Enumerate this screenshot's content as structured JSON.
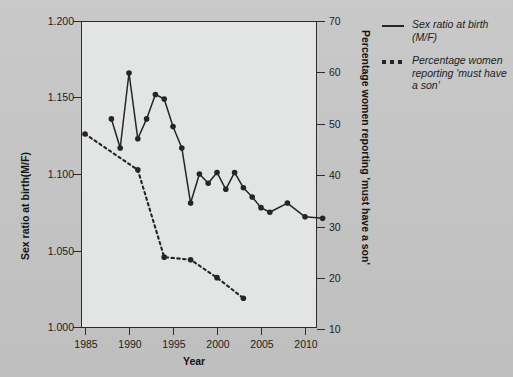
{
  "figure": {
    "background_color": "#c5c5c5",
    "plot_background_color": "#e3e4e4",
    "line_color": "#252525"
  },
  "chart_data": {
    "type": "line",
    "title": "",
    "xlabel": "Year",
    "ylabel_left": "Sex ratio at birth(M/F)",
    "ylabel_right": "Percentage women reporting 'must have a son'",
    "xlim": [
      1983,
      2014
    ],
    "xticks": [
      1985,
      1990,
      1995,
      2000,
      2005,
      2010
    ],
    "xticklabels": [
      "1985",
      "1990",
      "1995",
      "2000",
      "2005",
      "2010"
    ],
    "ylim_left": [
      1.0,
      1.2
    ],
    "yticks_left": [
      1.0,
      1.05,
      1.1,
      1.15,
      1.2
    ],
    "yticklabels_left": [
      "1.000",
      "1.050",
      "1.100",
      "1.150",
      "1.200"
    ],
    "ylim_right": [
      10,
      70
    ],
    "yticks_right": [
      10,
      20,
      30,
      40,
      50,
      60,
      70
    ],
    "yticklabels_right": [
      "10",
      "20",
      "30",
      "40",
      "50",
      "60",
      "70"
    ],
    "grid": false,
    "legend_position": "right-outside",
    "series": [
      {
        "name": "Sex ratio at birth (M/F)",
        "axis": "left",
        "style": "solid",
        "marker": "circle",
        "x": [
          1988,
          1989,
          1990,
          1991,
          1992,
          1993,
          1994,
          1995,
          1996,
          1997,
          1998,
          1999,
          2000,
          2001,
          2002,
          2003,
          2004,
          2005,
          2006,
          2008,
          2010,
          2012
        ],
        "y": [
          1.136,
          1.117,
          1.166,
          1.123,
          1.136,
          1.152,
          1.149,
          1.131,
          1.117,
          1.081,
          1.1,
          1.094,
          1.101,
          1.09,
          1.101,
          1.091,
          1.085,
          1.078,
          1.075,
          1.081,
          1.072,
          1.071
        ]
      },
      {
        "name": "Percentage women reporting 'must have a son'",
        "axis": "right",
        "style": "dashed",
        "marker": "circle",
        "x": [
          1985,
          1991,
          1994,
          1997,
          2000,
          2003
        ],
        "y": [
          48,
          41,
          24,
          23.5,
          20,
          16
        ]
      }
    ]
  },
  "legend": {
    "entries": [
      {
        "label": "Sex ratio at birth (M/F)",
        "style": "solid"
      },
      {
        "label": "Percentage women reporting 'must have a son'",
        "style": "dashed"
      }
    ]
  },
  "axes": {
    "x_title": "Year",
    "y_left_title": "Sex ratio at birth(M/F)",
    "y_right_title": "Percentage women reporting 'must have a son'"
  }
}
